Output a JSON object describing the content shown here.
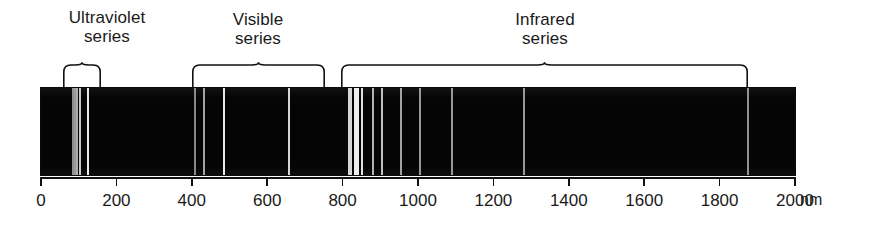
{
  "figure": {
    "unit_label": "nm",
    "background_color": "#ffffff",
    "band_color": "#050505",
    "line_color": "#f4f4f4",
    "axis_color": "#111111"
  },
  "groups": [
    {
      "id": "ultraviolet",
      "label": "Ultraviolet\nseries",
      "label_center_px": 107,
      "brace_start_px": 63,
      "brace_end_px": 101,
      "range_nm": [
        60,
        160
      ]
    },
    {
      "id": "visible",
      "label": "Visible\nseries",
      "label_center_px": 258,
      "brace_start_px": 192,
      "brace_end_px": 325,
      "range_nm": [
        400,
        755
      ]
    },
    {
      "id": "infrared",
      "label": "Infrared\nseries",
      "label_center_px": 545,
      "brace_start_px": 341,
      "brace_end_px": 748,
      "range_nm": [
        795,
        1875
      ]
    }
  ],
  "axis": {
    "min_nm": 0,
    "max_nm": 2000,
    "ticks": [
      {
        "value": 0,
        "label": "0"
      },
      {
        "value": 200,
        "label": "200"
      },
      {
        "value": 400,
        "label": "400"
      },
      {
        "value": 600,
        "label": "600"
      },
      {
        "value": 800,
        "label": "800"
      },
      {
        "value": 1000,
        "label": "1000"
      },
      {
        "value": 1200,
        "label": "1200"
      },
      {
        "value": 1400,
        "label": "1400"
      },
      {
        "value": 1600,
        "label": "1600"
      },
      {
        "value": 1800,
        "label": "1800"
      },
      {
        "value": 2000,
        "label": "2000"
      }
    ]
  },
  "chart_data": {
    "type": "line",
    "xlabel": "nm",
    "ylabel": "",
    "xlim": [
      0,
      2000
    ],
    "grid": false,
    "legend": "none",
    "annotations": [
      "Ultraviolet series",
      "Visible series",
      "Infrared series"
    ],
    "series": [
      {
        "name": "Ultraviolet series",
        "x": [
          93,
          95,
          97,
          102,
          121
        ],
        "intensity": [
          0.55,
          0.6,
          0.7,
          0.8,
          0.95
        ],
        "width_nm": [
          2,
          2,
          2.5,
          3,
          4
        ]
      },
      {
        "name": "Visible series",
        "x": [
          410,
          434,
          486,
          656
        ],
        "intensity": [
          0.5,
          0.6,
          0.9,
          0.85
        ],
        "width_nm": [
          3,
          3,
          5,
          4
        ]
      },
      {
        "name": "Infrared series",
        "x": [
          820,
          835,
          850,
          880,
          905,
          955,
          1005,
          1090,
          1280,
          1875
        ],
        "intensity": [
          0.85,
          0.95,
          0.9,
          0.7,
          0.75,
          0.65,
          0.6,
          0.6,
          0.6,
          0.55
        ],
        "width_nm": [
          9,
          12,
          6,
          4,
          4,
          5,
          4,
          4,
          4,
          4
        ]
      }
    ]
  },
  "spectrum_lines_px": [
    {
      "x": 73,
      "w": 1.2,
      "b": 0.58
    },
    {
      "x": 75,
      "w": 1.2,
      "b": 0.62
    },
    {
      "x": 77,
      "w": 1.4,
      "b": 0.7
    },
    {
      "x": 80,
      "w": 1.8,
      "b": 0.82
    },
    {
      "x": 88,
      "w": 2.2,
      "b": 0.96
    },
    {
      "x": 195,
      "w": 1.4,
      "b": 0.55
    },
    {
      "x": 204,
      "w": 1.6,
      "b": 0.66
    },
    {
      "x": 224,
      "w": 2.2,
      "b": 0.95
    },
    {
      "x": 289,
      "w": 1.8,
      "b": 0.88
    },
    {
      "x": 350,
      "w": 3.2,
      "b": 0.88
    },
    {
      "x": 356,
      "w": 5.0,
      "b": 0.98
    },
    {
      "x": 362,
      "w": 2.4,
      "b": 0.92
    },
    {
      "x": 373,
      "w": 1.8,
      "b": 0.72
    },
    {
      "x": 382,
      "w": 1.8,
      "b": 0.78
    },
    {
      "x": 401,
      "w": 1.8,
      "b": 0.66
    },
    {
      "x": 420,
      "w": 1.6,
      "b": 0.62
    },
    {
      "x": 452,
      "w": 1.8,
      "b": 0.62
    },
    {
      "x": 524,
      "w": 1.8,
      "b": 0.62
    },
    {
      "x": 748,
      "w": 1.8,
      "b": 0.58
    }
  ],
  "layout_px": {
    "band": {
      "left": 41,
      "top": 88,
      "width": 754,
      "height": 87
    },
    "axis": {
      "left": 41,
      "top": 177,
      "width": 754
    },
    "tick_label_y": 191,
    "unit_label": {
      "left": 800,
      "top": 191
    },
    "brace_top": 62,
    "brace_height": 26
  }
}
